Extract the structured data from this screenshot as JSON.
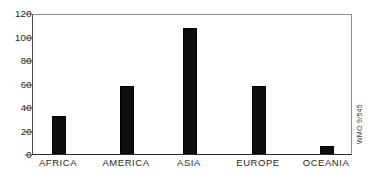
{
  "chart_data": {
    "type": "bar",
    "title": "",
    "subtitle": "",
    "xlabel": "",
    "ylabel": "",
    "categories": [
      "AFRICA",
      "AMERICA",
      "ASIA",
      "EUROPE",
      "OCEANIA"
    ],
    "values": [
      33,
      58,
      108,
      58,
      7
    ],
    "ylim": [
      0,
      120
    ],
    "ytick_labels": [
      "0",
      "20",
      "40",
      "60",
      "80",
      "100",
      "120"
    ],
    "ytick_values": [
      0,
      20,
      40,
      60,
      80,
      100,
      120
    ],
    "grid": false,
    "legend": null,
    "bar_color": "#0d0d0d",
    "axis_color": "#2b2b2b",
    "frame_color": "#8c8c8c",
    "background": "#ffffff",
    "annotations": [
      {
        "name": "source-credit",
        "text": "WMO 9/545",
        "position": "right-edge-vertical"
      }
    ]
  }
}
